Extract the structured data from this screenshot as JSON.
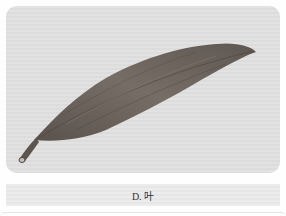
{
  "figure": {
    "caption": "D. 叶",
    "colors": {
      "background": "#dedede",
      "leaf_main": "#6e6660",
      "leaf_dark": "#4c4540",
      "caption_text": "#333333"
    }
  }
}
